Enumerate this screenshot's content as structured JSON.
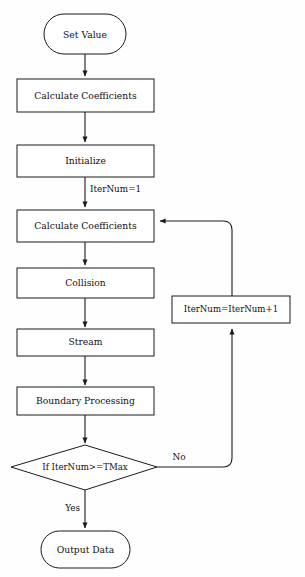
{
  "diagram": {
    "type": "flowchart",
    "background_color": "#fefefe",
    "stroke_color": "#1a1a1a",
    "fill_color": "#ffffff"
  },
  "nodes": {
    "start": {
      "label": "Set Value",
      "shape": "terminal"
    },
    "calc_coeff_1": {
      "label": "Calculate Coefficients",
      "shape": "process"
    },
    "initialize": {
      "label": "Initialize",
      "shape": "process"
    },
    "calc_coeff_2": {
      "label": "Calculate Coefficients",
      "shape": "process"
    },
    "collision": {
      "label": "Collision",
      "shape": "process"
    },
    "stream": {
      "label": "Stream",
      "shape": "process"
    },
    "boundary": {
      "label": "Boundary Processing",
      "shape": "process"
    },
    "decision": {
      "label": "If IterNum>=TMax",
      "shape": "decision"
    },
    "increment": {
      "label": "IterNum=IterNum+1",
      "shape": "process"
    },
    "end": {
      "label": "Output Data",
      "shape": "terminal"
    }
  },
  "edge_labels": {
    "init_to_calc": "IterNum=1",
    "decision_yes": "Yes",
    "decision_no": "No"
  }
}
